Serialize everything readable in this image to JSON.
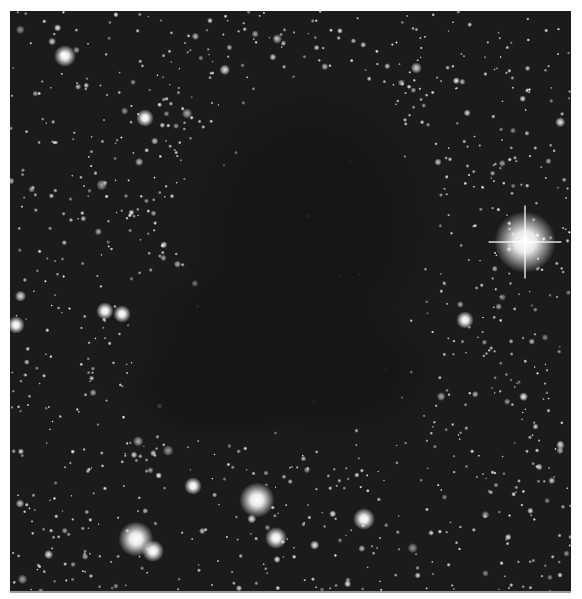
{
  "image": {
    "subject": "dark molecular cloud against dense star field",
    "background_color": "#1b1b1b",
    "cloud_color": "#151515",
    "star_color": "#ffffff",
    "frame": {
      "left": 10,
      "top": 11,
      "width": 561,
      "height": 580
    },
    "cloud_ellipses": [
      {
        "cx": 300,
        "cy": 215,
        "rx": 130,
        "ry": 150
      },
      {
        "cx": 240,
        "cy": 330,
        "rx": 120,
        "ry": 90
      },
      {
        "cx": 205,
        "cy": 380,
        "rx": 90,
        "ry": 50
      },
      {
        "cx": 320,
        "cy": 360,
        "rx": 110,
        "ry": 70
      }
    ],
    "bright_stars": [
      {
        "x": 515,
        "y": 231,
        "r": 14,
        "spikes": true
      },
      {
        "x": 247,
        "y": 489,
        "r": 8,
        "spikes": false
      },
      {
        "x": 126,
        "y": 528,
        "r": 8,
        "spikes": false
      },
      {
        "x": 143,
        "y": 540,
        "r": 5,
        "spikes": false
      },
      {
        "x": 266,
        "y": 527,
        "r": 5,
        "spikes": false
      },
      {
        "x": 354,
        "y": 508,
        "r": 5,
        "spikes": false
      },
      {
        "x": 55,
        "y": 45,
        "r": 5,
        "spikes": false
      },
      {
        "x": 95,
        "y": 300,
        "r": 4,
        "spikes": false
      },
      {
        "x": 112,
        "y": 303,
        "r": 4,
        "spikes": false
      },
      {
        "x": 6,
        "y": 314,
        "r": 4,
        "spikes": false
      },
      {
        "x": 455,
        "y": 309,
        "r": 4,
        "spikes": false
      },
      {
        "x": 135,
        "y": 107,
        "r": 4,
        "spikes": false
      },
      {
        "x": 183,
        "y": 475,
        "r": 4,
        "spikes": false
      }
    ],
    "star_count": 2600,
    "seed": 68
  },
  "caption": {
    "text": ""
  }
}
